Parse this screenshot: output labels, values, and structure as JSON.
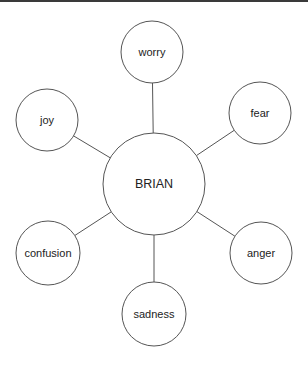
{
  "diagram": {
    "type": "mind-map",
    "center": {
      "label": "BRIAN",
      "cx": 154,
      "cy": 184,
      "r": 51
    },
    "nodes": [
      {
        "label": "worry",
        "cx": 152,
        "cy": 52,
        "r": 31
      },
      {
        "label": "fear",
        "cx": 260,
        "cy": 113,
        "r": 31
      },
      {
        "label": "anger",
        "cx": 261,
        "cy": 253,
        "r": 31
      },
      {
        "label": "sadness",
        "cx": 154,
        "cy": 314,
        "r": 32
      },
      {
        "label": "confusion",
        "cx": 48,
        "cy": 253,
        "r": 32
      },
      {
        "label": "joy",
        "cx": 47,
        "cy": 120,
        "r": 31
      }
    ],
    "colors": {
      "stroke": "#555555",
      "text": "#222222",
      "background": "#ffffff",
      "top_bar": "#3a3a3a"
    }
  }
}
